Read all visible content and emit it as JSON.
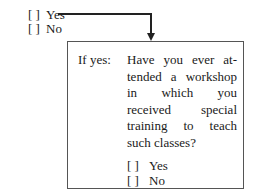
{
  "outer_options": [
    {
      "bracket": "[  ]",
      "label": "Yes"
    },
    {
      "bracket": "[  ]",
      "label": "No"
    }
  ],
  "followup": {
    "condition_label": "If yes:",
    "question": "Have you ever at­tended a workshop in which you received special training to teach such classes?",
    "options": [
      {
        "bracket": "[   ]",
        "label": "Yes"
      },
      {
        "bracket": "[   ]",
        "label": "No"
      }
    ]
  },
  "colors": {
    "text": "#1a1a1a",
    "line": "#222222",
    "border": "#555555"
  }
}
